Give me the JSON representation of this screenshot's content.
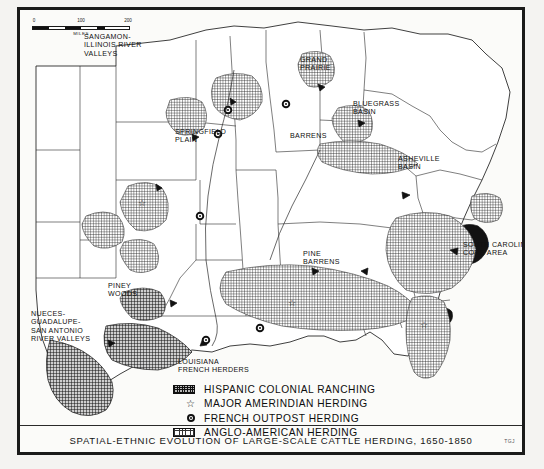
{
  "plate": {
    "caption": "SPATIAL-ETHNIC EVOLUTION OF LARGE-SCALE CATTLE HERDING, 1650-1850",
    "credit": "TGJ"
  },
  "scale": {
    "tick_0": "0",
    "tick_100": "100",
    "tick_200": "200",
    "units": "MILES"
  },
  "legend": {
    "items": [
      {
        "symbol": "dark-hatch-swatch",
        "label": "HISPANIC COLONIAL RANCHING"
      },
      {
        "symbol": "star",
        "label": "MAJOR AMERINDIAN HERDING"
      },
      {
        "symbol": "circle-dot",
        "label": "FRENCH OUTPOST HERDING"
      },
      {
        "symbol": "light-hatch-swatch",
        "label": "ANGLO-AMERICAN HERDING"
      }
    ]
  },
  "map_labels": [
    {
      "name": "sangamon-illinois-river-valleys",
      "text": "SANGAMON-\nILLINOIS RIVER\nVALLEYS"
    },
    {
      "name": "grand-prairie",
      "text": "GRAND\nPRAIRIE"
    },
    {
      "name": "bluegrass-basin",
      "text": "BLUEGRASS\nBASIN"
    },
    {
      "name": "springfield-plain",
      "text": "SPRINGFIELD\nPLAIN"
    },
    {
      "name": "barrens",
      "text": "BARRENS"
    },
    {
      "name": "asheville-basin",
      "text": "ASHEVILLE\nBASIN"
    },
    {
      "name": "pine-barrens",
      "text": "PINE\nBARRENS"
    },
    {
      "name": "south-carolina-core-area",
      "text": "SOUTH CAROLINA\nCORE AREA"
    },
    {
      "name": "piney-woods",
      "text": "PINEY\nWOODS"
    },
    {
      "name": "nueces-guadalupe-san-antonio-river-valleys",
      "text": "NUECES-\nGUADALUPE-\nSAN ANTONIO\nRIVER VALLEYS"
    },
    {
      "name": "louisiana-french-herders",
      "text": "LOUISIANA\nFRENCH HERDERS"
    }
  ],
  "colors": {
    "ink": "#111111",
    "paper": "#fbfbf9",
    "frame": "#1a1a1a"
  }
}
